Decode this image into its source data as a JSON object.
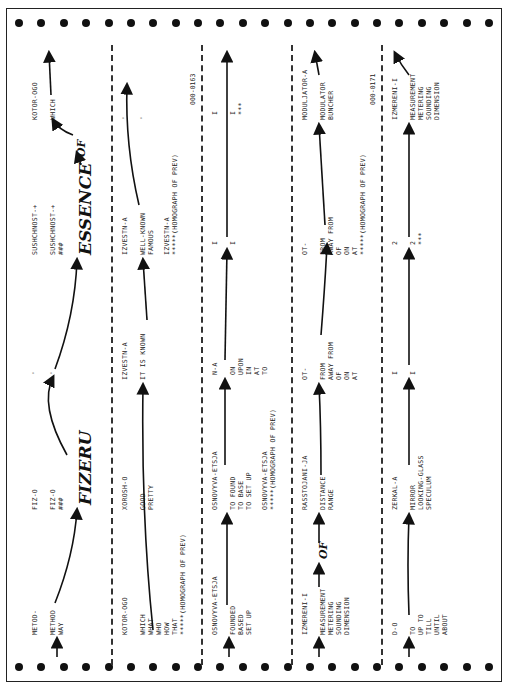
{
  "document": {
    "type": "rotated machine-translation printout",
    "bands": [
      {
        "id": 1,
        "entries": [
          {
            "head": "METOD-",
            "glosses": [
              "METHOD",
              "WAY"
            ]
          },
          {
            "head": "FIZ-O",
            "glosses": [
              "FIZ-O",
              "###"
            ],
            "handwritten": "FIZERU"
          },
          {
            "head": "'",
            "glosses": [
              "'"
            ]
          },
          {
            "head": "SUSHCHNOST-+",
            "glosses": [
              "SUSHCHNOST-+",
              "###"
            ],
            "handwritten": "ESSENCE"
          },
          {
            "head": "KOTOR-OGO",
            "glosses": [
              "WHICH"
            ]
          }
        ],
        "handwritten_connector": "OF"
      },
      {
        "id": 2,
        "entries": [
          {
            "head": "KOTOR-OGO",
            "glosses": [
              "WHICH",
              "WHAT",
              "WHO",
              "HOW",
              "THAT",
              "*****(HOMOGRAPH OF PREV)"
            ]
          },
          {
            "head": "XOROSH-O",
            "glosses": [
              "GOOD",
              "PRETTY"
            ]
          },
          {
            "head": "IZVESTN-A",
            "glosses": [
              "IT IS KNOWN"
            ]
          },
          {
            "head": "IZVESTN-A",
            "glosses": [
              "WELL-KNOWN",
              "FAMOUS",
              "",
              "IZVESTN-A",
              "*****(HOMOGRAPH OF PREV)"
            ]
          },
          {
            "head": "'",
            "glosses": [
              "'"
            ]
          }
        ],
        "sentence_id": "000-0163"
      },
      {
        "id": 3,
        "entries": [
          {
            "head": "OSNOVYVA-ETSJA",
            "glosses": [
              "FOUNDED",
              "BASED",
              "SET UP"
            ]
          },
          {
            "head": "OSNOVYVA-ETSJA",
            "glosses": [
              "TO FOUND",
              "TO BASE",
              "TO SET UP",
              "",
              "OSNOVYVA-ETSJA",
              "*****(HOMOGRAPH OF PREV)"
            ]
          },
          {
            "head": "N-A",
            "glosses": [
              "ON",
              "UPON",
              "IN",
              "AT",
              "TO"
            ]
          },
          {
            "head": "I",
            "glosses": [
              "I"
            ]
          },
          {
            "head": "I",
            "glosses": [
              "I",
              "***"
            ]
          }
        ]
      },
      {
        "id": 4,
        "entries": [
          {
            "head": "IZMERENI-I",
            "glosses": [
              "MEASUREMENT",
              "METERING",
              "SOUNDING",
              "DIMENSION"
            ]
          },
          {
            "head": "RASSTOJANI-JA",
            "glosses": [
              "DISTANCE",
              "RANGE"
            ]
          },
          {
            "head": "OT-",
            "glosses": [
              "FROM",
              "AWAY FROM",
              "OF",
              "ON",
              "AT"
            ]
          },
          {
            "head": "OT-",
            "glosses": [
              "FROM",
              "AWAY FROM",
              "OF",
              "ON",
              "AT",
              "*****(HOMOGRAPH OF PREV)"
            ]
          },
          {
            "head": "MODULJATOR-A",
            "glosses": [
              "MODULATOR",
              "BUNCHER"
            ]
          }
        ],
        "handwritten_connector": "OF",
        "sentence_id": "000-0171"
      },
      {
        "id": 5,
        "entries": [
          {
            "head": "D-O",
            "glosses": [
              "TO",
              "UP TO",
              "TILL",
              "UNTIL",
              "ABOUT"
            ]
          },
          {
            "head": "ZERKAL-A",
            "glosses": [
              "MIRROR",
              "LOOKING-GLASS",
              "SPECULUM"
            ]
          },
          {
            "head": "I",
            "glosses": [
              "I"
            ]
          },
          {
            "head": "2",
            "glosses": [
              "2",
              "***"
            ]
          },
          {
            "head": "IZMERENI-I",
            "glosses": [
              "MEASUREMENT",
              "METERING",
              "SOUNDING",
              "DIMENSION"
            ]
          }
        ]
      }
    ]
  },
  "labels": {
    "b1": {
      "c1h": "METOD-",
      "c1g": "METHOD\nWAY",
      "c2h": "FIZ-O",
      "c2g": "FIZ-O\n###",
      "c3h": "'",
      "c3g": "'",
      "c4h": "SUSHCHNOST-+",
      "c4g": "SUSHCHNOST-+\n###",
      "c5h": "KOTOR-OGO",
      "c5g": "WHICH",
      "hw1": "FIZERU",
      "hw2": "ESSENCE",
      "hw3": "OF"
    },
    "b2": {
      "c1h": "KOTOR-OGO",
      "c1g": "WHICH\nWHAT\nWHO\nHOW\nTHAT\n*****(HOMOGRAPH OF PREV)",
      "c2h": "XOROSH-O",
      "c2g": "GOOD\nPRETTY",
      "c3h": "IZVESTN-A",
      "c3g": "IT IS KNOWN",
      "c4h": "IZVESTN-A",
      "c4g": "WELL-KNOWN\nFAMOUS\n\nIZVESTN-A\n*****(HOMOGRAPH OF PREV)",
      "c5h": "'",
      "c5g": "'",
      "id": "000-0163"
    },
    "b3": {
      "c1h": "OSNOVYVA-ETSJA",
      "c1g": "FOUNDED\nBASED\nSET UP",
      "c2h": "OSNOVYVA-ETSJA",
      "c2g": "TO FOUND\nTO BASE\nTO SET UP\n\nOSNOVYVA-ETSJA\n*****(HOMOGRAPH OF PREV)",
      "c3h": "N-A",
      "c3g": "ON\nUPON\nIN\nAT\nTO",
      "c4h": "I",
      "c4g": "I",
      "c5h": "I",
      "c5g": "I\n***"
    },
    "b4": {
      "c1h": "IZMERENI-I",
      "c1g": "MEASUREMENT\nMETERING\nSOUNDING\nDIMENSION",
      "c2h": "RASSTOJANI-JA",
      "c2g": "DISTANCE\nRANGE",
      "c3h": "OT-",
      "c3g": "FROM\nAWAY FROM\nOF\nON\nAT",
      "c4h": "OT-",
      "c4g": "FROM\nAWAY FROM\nOF\nON\nAT\n*****(HOMOGRAPH OF PREV)",
      "c5h": "MODULJATOR-A",
      "c5g": "MODULATOR\nBUNCHER",
      "hw": "OF",
      "id": "000-0171"
    },
    "b5": {
      "c1h": "D-O",
      "c1g": "TO\nUP TO\nTILL\nUNTIL\nABOUT",
      "c2h": "ZERKAL-A",
      "c2g": "MIRROR\nLOOKING-GLASS\nSPECULUM",
      "c3h": "I",
      "c3g": "I",
      "c4h": "2",
      "c4g": "2\n***",
      "c5h": "IZMERENI-I",
      "c5g": "MEASUREMENT\nMETERING\nSOUNDING\nDIMENSION"
    }
  }
}
